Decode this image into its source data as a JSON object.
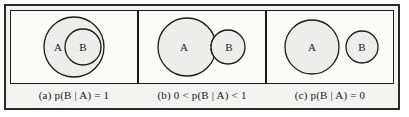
{
  "figure": {
    "colors": {
      "frame_border": "#2a2a2a",
      "panel_border": "#1c1c1c",
      "page_background": "#f2f2f0",
      "panel_background": "#fbfbfa",
      "circle_fill": "#ededeb",
      "circle_stroke": "#1a1a1a",
      "text": "#1a1a1a"
    }
  },
  "panels": [
    {
      "id": "a",
      "caption": "(a) p(B | A) = 1",
      "relationship": "B is entirely contained within A",
      "sets": [
        {
          "label": "A",
          "role": "outer-circle"
        },
        {
          "label": "B",
          "role": "inner-circle"
        }
      ],
      "divider": "none"
    },
    {
      "id": "b",
      "caption": "(b) 0 < p(B | A) < 1",
      "relationship": "A and B partially overlap",
      "sets": [
        {
          "label": "A",
          "role": "left-circle"
        },
        {
          "label": "B",
          "role": "right-circle"
        }
      ],
      "divider": "dotted-intersection-arc"
    },
    {
      "id": "c",
      "caption": "(c) p(B | A) = 0",
      "relationship": "A and B are disjoint",
      "sets": [
        {
          "label": "A",
          "role": "left-circle"
        },
        {
          "label": "B",
          "role": "right-circle"
        }
      ],
      "divider": "none"
    }
  ]
}
